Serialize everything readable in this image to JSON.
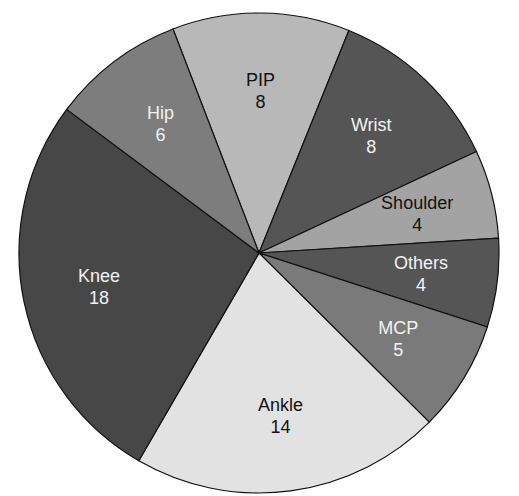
{
  "chart_data": {
    "type": "pie",
    "title": "",
    "slices": [
      {
        "label": "PIP",
        "value": 8,
        "color": "#b8b8b8",
        "text_color": "#111111"
      },
      {
        "label": "Wrist",
        "value": 8,
        "color": "#555555",
        "text_color": "#f2f2f2"
      },
      {
        "label": "Shoulder",
        "value": 4,
        "color": "#a3a3a3",
        "text_color": "#111111"
      },
      {
        "label": "Others",
        "value": 4,
        "color": "#555555",
        "text_color": "#f2f2f2"
      },
      {
        "label": "MCP",
        "value": 5,
        "color": "#7a7a7a",
        "text_color": "#f2f2f2"
      },
      {
        "label": "Ankle",
        "value": 14,
        "color": "#e2e2e2",
        "text_color": "#111111"
      },
      {
        "label": "Knee",
        "value": 18,
        "color": "#474747",
        "text_color": "#f2f2f2"
      },
      {
        "label": "Hip",
        "value": 6,
        "color": "#7d7d7d",
        "text_color": "#f2f2f2"
      }
    ],
    "start_angle_deg": -21,
    "direction": "clockwise",
    "legend": "none",
    "labels": "inside"
  }
}
